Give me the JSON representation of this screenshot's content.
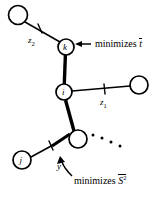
{
  "figure": {
    "type": "phylogenetic-tree-diagram",
    "background_color": "#ffffff",
    "line_color": "#000000",
    "nodes": [
      {
        "id": "tip-top-left",
        "label": "",
        "cx": 18,
        "cy": 15,
        "r": 9.5,
        "filled": false
      },
      {
        "id": "node-k",
        "label": "k",
        "cx": 66,
        "cy": 47,
        "r": 8,
        "filled": false
      },
      {
        "id": "node-i",
        "label": "i",
        "cx": 64,
        "cy": 92,
        "r": 8,
        "filled": false
      },
      {
        "id": "tip-right",
        "label": "",
        "cx": 139,
        "cy": 85,
        "r": 9,
        "filled": false
      },
      {
        "id": "node-lower-junction",
        "label": "",
        "cx": 78,
        "cy": 139,
        "r": 9,
        "filled": false
      },
      {
        "id": "node-j",
        "label": "j",
        "cx": 22,
        "cy": 160,
        "r": 9,
        "filled": false
      }
    ],
    "branch_labels": [
      {
        "id": "branch-z2",
        "base": "z",
        "subscript": "2",
        "x": 28,
        "y": 41
      },
      {
        "id": "branch-z1",
        "base": "z",
        "subscript": "1",
        "x": 100,
        "y": 103
      },
      {
        "id": "branch-y",
        "base": "y",
        "subscript": "",
        "x": 57,
        "y": 167
      }
    ],
    "annotations": [
      {
        "id": "annotation-minimizes-t",
        "text": "minimizes",
        "symbol": "t",
        "symbol_style": "overline",
        "x": 93,
        "y": 39
      },
      {
        "id": "annotation-minimizes-s2",
        "text": "minimizes",
        "symbol": "S",
        "superscript": "2",
        "symbol_style": "overline",
        "x": 73,
        "y": 176
      }
    ],
    "ellipsis": {
      "id": "ellipsis-dots",
      "count": 4,
      "x": 96,
      "y": 139
    }
  }
}
